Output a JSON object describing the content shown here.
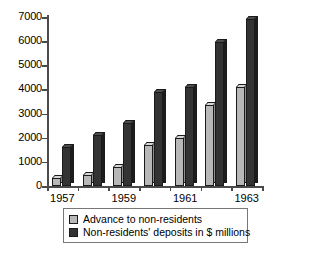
{
  "chart_data": {
    "type": "bar",
    "title": "",
    "subtitle": "",
    "xlabel": "",
    "ylabel": "",
    "ylim": [
      0,
      7000
    ],
    "ytick_step": 1000,
    "yticks": [
      "0",
      "1000",
      "2000",
      "3000",
      "4000",
      "5000",
      "6000",
      "7000"
    ],
    "grid": false,
    "legend_position": "bottom",
    "categories": [
      "1957",
      "1958",
      "1959",
      "1960",
      "1961",
      "1962",
      "1963"
    ],
    "visible_xtick_labels": [
      "1957",
      "1959",
      "1961",
      "1963"
    ],
    "series": [
      {
        "name": "Advance to non-residents",
        "color": "#b8b8b8",
        "values": [
          350,
          450,
          800,
          1700,
          2000,
          3350,
          4100
        ]
      },
      {
        "name": "Non-residents' deposits in $ millions",
        "color": "#333333",
        "values": [
          1600,
          2100,
          2600,
          3900,
          4100,
          5950,
          6900
        ]
      }
    ]
  },
  "legend": {
    "items": [
      {
        "label": "Advance to non-residents",
        "swatch": "light-gray-swatch"
      },
      {
        "label": "Non-residents' deposits in $ millions",
        "swatch": "dark-swatch"
      }
    ]
  }
}
